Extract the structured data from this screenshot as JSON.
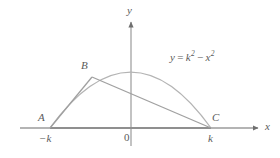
{
  "figure": {
    "background_color": "#ffffff",
    "stroke_color": "#9a9a9a",
    "axis_color": "#8c8c8c",
    "emphasis_color": "#7a7a7a",
    "text_color": "#5a5a5a"
  },
  "axes": {
    "x_label": "x",
    "y_label": "y",
    "origin_label": "0",
    "x_axis": {
      "x_start": 20,
      "x_end": 262,
      "y": 128
    },
    "y_axis": {
      "x": 131,
      "y_start": 18,
      "y_end": 146
    }
  },
  "curve": {
    "equation_label": {
      "lhs": "y",
      "equals": "=",
      "k_base": "k",
      "k_exp": "2",
      "minus": "−",
      "x_base": "x",
      "x_exp": "2"
    },
    "path": "M 50 128 Q 131 16 211 128",
    "vertex": {
      "x": 131,
      "y": 63
    }
  },
  "points": [
    {
      "name": "A",
      "label": "A",
      "x": 50,
      "y": 128,
      "tick_label": "−k",
      "label_dx": -12,
      "label_dy": -14
    },
    {
      "name": "B",
      "label": "B",
      "x": 92,
      "y": 77,
      "tick_label": "",
      "label_dx": -11,
      "label_dy": -15
    },
    {
      "name": "C",
      "label": "C",
      "x": 211,
      "y": 128,
      "tick_label": "k",
      "label_dx": 2,
      "label_dy": -14
    }
  ],
  "segments": [
    {
      "name": "segment-ab",
      "from": "A",
      "to": "B"
    },
    {
      "name": "segment-bc",
      "from": "B",
      "to": "C"
    },
    {
      "name": "segment-ac",
      "from": "A",
      "to": "C"
    }
  ],
  "tick_labels": {
    "minus_k": "−k",
    "k": "k"
  }
}
